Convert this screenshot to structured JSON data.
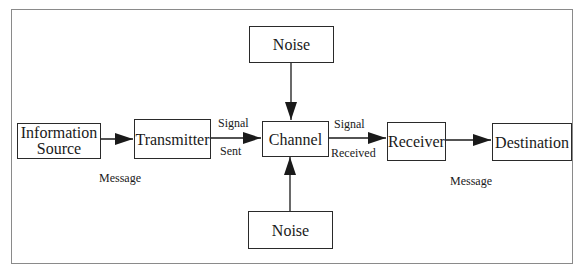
{
  "diagram": {
    "title": "",
    "nodes": {
      "information_source": "Information Source",
      "information_source_line1": "Information",
      "information_source_line2": "Source",
      "transmitter": "Transmitter",
      "channel": "Channel",
      "receiver": "Receiver",
      "destination": "Destination",
      "noise_top": "Noise",
      "noise_bottom": "Noise"
    },
    "edge_labels": {
      "message_left": "Message",
      "signal_sent_top": "Signal",
      "signal_sent_bottom": "Sent",
      "signal_received_top": "Signal",
      "signal_received_bottom": "Received",
      "message_right": "Message"
    },
    "edges": [
      {
        "from": "Information Source",
        "to": "Transmitter",
        "label": "Message"
      },
      {
        "from": "Transmitter",
        "to": "Channel",
        "label": "Signal Sent"
      },
      {
        "from": "Noise (top)",
        "to": "Channel",
        "label": ""
      },
      {
        "from": "Noise (bottom)",
        "to": "Channel",
        "label": ""
      },
      {
        "from": "Channel",
        "to": "Receiver",
        "label": "Signal Received"
      },
      {
        "from": "Receiver",
        "to": "Destination",
        "label": "Message"
      }
    ],
    "colors": {
      "stroke": "#2a2a2a",
      "frame": "#8a8a8a",
      "background": "#ffffff"
    }
  }
}
